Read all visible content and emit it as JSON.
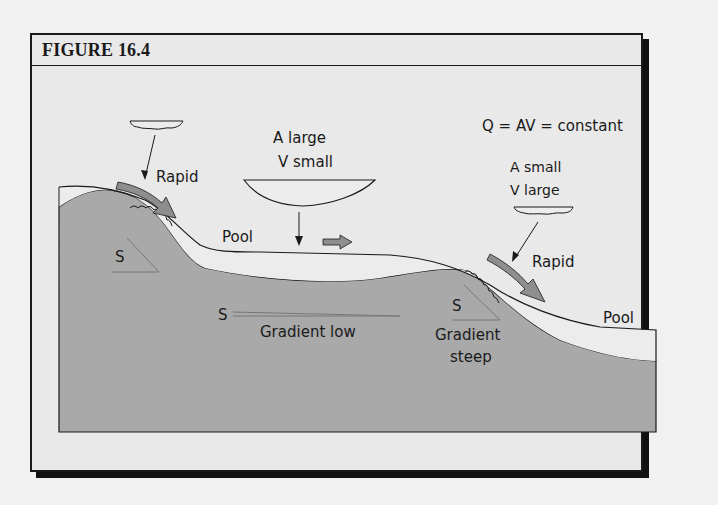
{
  "figure": {
    "title": "FIGURE 16.4",
    "equation": "Q = AV = constant",
    "labels": {
      "rapid_left": "Rapid",
      "rapid_right": "Rapid",
      "pool_middle": "Pool",
      "pool_right": "Pool",
      "a_large": "A large",
      "v_small": "V small",
      "a_small": "A small",
      "v_large": "V large",
      "s_left": "S",
      "s_middle": "S",
      "s_right": "S",
      "gradient_low": "Gradient low",
      "gradient_steep_1": "Gradient",
      "gradient_steep_2": "steep"
    },
    "colors": {
      "background": "#e9e9e9",
      "bed": "#a9a9a9",
      "water": "#ececec",
      "flow_arrow": "#8e8e8e",
      "line": "#1a1a1a"
    }
  }
}
